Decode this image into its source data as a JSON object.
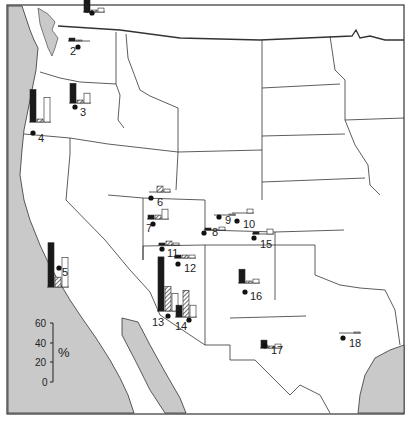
{
  "figure": {
    "type": "map_with_bar_glyphs",
    "region": "Western United States",
    "colors": {
      "ocean": "#c9c9c9",
      "land": "#ffffff",
      "border": "#333333",
      "bar_solid": "#1a1a1a",
      "bar_hatched": "#888888",
      "bar_open": "#ffffff"
    }
  },
  "scale_bar": {
    "unit": "%",
    "ticks": [
      "60",
      "40",
      "20",
      "0"
    ]
  },
  "chart_data": {
    "type": "bar",
    "title": "",
    "ylabel": "%",
    "ylim": [
      0,
      60
    ],
    "series": [
      {
        "name": "solid"
      },
      {
        "name": "hatched"
      },
      {
        "name": "open"
      }
    ],
    "sites": [
      {
        "id": "1",
        "values": [
          18,
          2,
          4
        ]
      },
      {
        "id": "2",
        "values": [
          3,
          1,
          0
        ]
      },
      {
        "id": "3",
        "values": [
          20,
          3,
          10
        ]
      },
      {
        "id": "4",
        "values": [
          33,
          3,
          25
        ]
      },
      {
        "id": "5",
        "values": [
          45,
          10,
          30
        ]
      },
      {
        "id": "6",
        "values": [
          0,
          6,
          3
        ]
      },
      {
        "id": "7",
        "values": [
          4,
          4,
          10
        ]
      },
      {
        "id": "8",
        "values": [
          2,
          0,
          3
        ]
      },
      {
        "id": "9",
        "values": [
          0,
          0,
          1
        ]
      },
      {
        "id": "10",
        "values": [
          0,
          0,
          4
        ]
      },
      {
        "id": "11",
        "values": [
          2,
          4,
          2
        ]
      },
      {
        "id": "12",
        "values": [
          3,
          3,
          3
        ]
      },
      {
        "id": "13",
        "values": [
          55,
          25,
          18
        ]
      },
      {
        "id": "14",
        "values": [
          12,
          27,
          12
        ]
      },
      {
        "id": "15",
        "values": [
          2,
          0,
          5
        ]
      },
      {
        "id": "16",
        "values": [
          14,
          2,
          4
        ]
      },
      {
        "id": "17",
        "values": [
          8,
          2,
          4
        ]
      },
      {
        "id": "18",
        "values": [
          0,
          0,
          1
        ]
      }
    ]
  },
  "site_labels": [
    "1",
    "2",
    "3",
    "4",
    "5",
    "6",
    "7",
    "8",
    "9",
    "10",
    "11",
    "12",
    "13",
    "14",
    "15",
    "16",
    "17",
    "18"
  ]
}
